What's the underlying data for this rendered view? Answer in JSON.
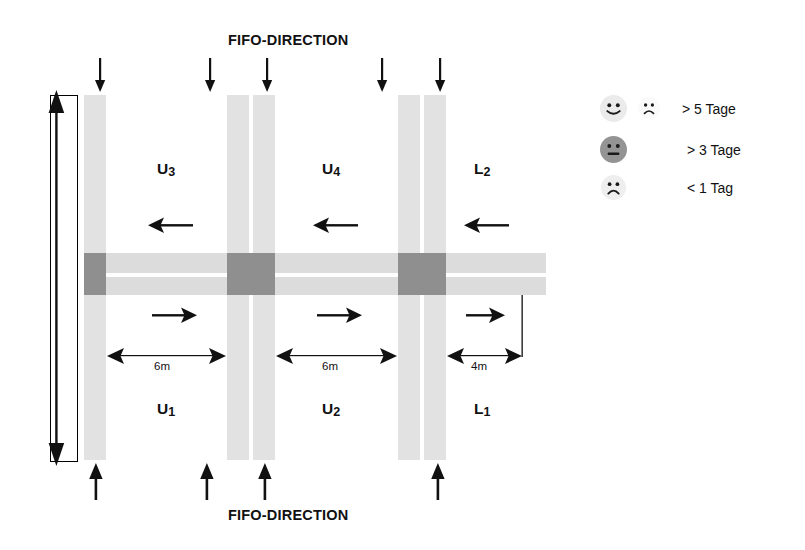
{
  "diagram": {
    "title_top": "FIFO-DIRECTION",
    "title_bottom": "FIFO-DIRECTION",
    "zones_upper": [
      {
        "name": "U",
        "sub": "3",
        "label": "U3"
      },
      {
        "name": "U",
        "sub": "4",
        "label": "U4"
      },
      {
        "name": "L",
        "sub": "2",
        "label": "L2"
      }
    ],
    "zones_lower": [
      {
        "name": "U",
        "sub": "1",
        "label": "U1"
      },
      {
        "name": "U",
        "sub": "2",
        "label": "U2"
      },
      {
        "name": "L",
        "sub": "1",
        "label": "L1"
      }
    ],
    "dimensions": [
      {
        "value": "6m"
      },
      {
        "value": "6m"
      },
      {
        "value": "4m"
      }
    ],
    "flow_upper_direction": "left",
    "flow_lower_direction": "right",
    "arrows_top_count": 5,
    "arrows_bottom_count": 4,
    "colors": {
      "rack": "#e2e2e2",
      "corridor": "#dcdcdc",
      "intersection": "#8f8f8f",
      "ink": "#111111",
      "background": "#ffffff"
    }
  },
  "legend": {
    "rows": [
      {
        "id": "gt5",
        "label": "> 5 Tage",
        "faces": [
          {
            "icon": "smiley-happy-icon",
            "mood": "happy",
            "fill": "#ebebeb",
            "size": 27
          },
          {
            "icon": "smiley-sad-icon",
            "mood": "sad",
            "fill": "#fafafa",
            "size": 22
          }
        ]
      },
      {
        "id": "gt3",
        "label": "> 3 Tage",
        "faces": [
          {
            "icon": "smiley-neutral-icon",
            "mood": "neutral",
            "fill": "#949494",
            "size": 27
          }
        ]
      },
      {
        "id": "lt1",
        "label": "< 1 Tag",
        "faces": [
          {
            "icon": "smiley-sad-icon",
            "mood": "sad",
            "fill": "#eeeeee",
            "size": 25
          }
        ]
      }
    ]
  }
}
